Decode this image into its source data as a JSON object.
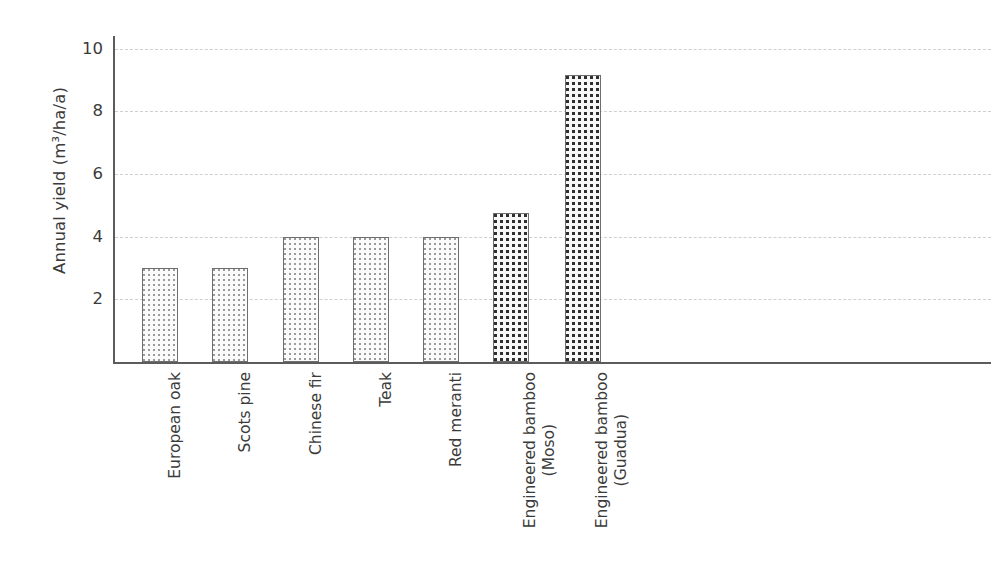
{
  "chart_data": {
    "type": "bar",
    "title": "",
    "xlabel": "",
    "ylabel": "Annual yield (m³/ha/a)",
    "categories": [
      "European oak",
      "Scots pine",
      "Chinese fir",
      "Teak",
      "Red meranti",
      "Engineered bamboo (Moso)",
      "Engineered bamboo (Guadua)"
    ],
    "category_lines": [
      [
        "European oak"
      ],
      [
        "Scots pine"
      ],
      [
        "Chinese fir"
      ],
      [
        "Teak"
      ],
      [
        "Red meranti"
      ],
      [
        "Engineered bamboo",
        "(Moso)"
      ],
      [
        "Engineered bamboo",
        "(Guadua)"
      ]
    ],
    "values": [
      3.0,
      3.0,
      4.0,
      4.0,
      4.0,
      4.75,
      9.15
    ],
    "ylim": [
      0,
      10.4
    ],
    "yticks": [
      2,
      4,
      6,
      8,
      10
    ],
    "ytick_labels": [
      "2",
      "4",
      "6",
      "8",
      "10"
    ],
    "grid": true,
    "grid_style": "dashed-horizontal",
    "legend": "none",
    "bar_patterns": [
      "fine-dots",
      "fine-dots",
      "fine-dots",
      "fine-dots",
      "fine-dots",
      "coarse-dots",
      "coarse-dots"
    ],
    "colors": {
      "axis": "#5c5c5c",
      "grid": "#cfcfcf",
      "bar_edge": "#6e6e6e",
      "bar_fill_light": "#fbfbfb",
      "bar_dot_light": "#9a9a9a",
      "bar_dot_dark": "#2e2e2e",
      "text": "#3b3b3b",
      "background": "#ffffff"
    }
  }
}
